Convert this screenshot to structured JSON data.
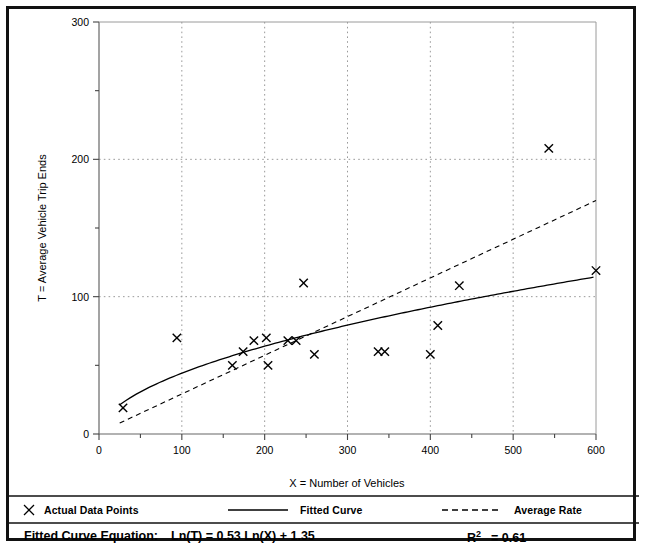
{
  "chart_data": {
    "type": "scatter",
    "title": "",
    "xlabel": "X = Number of Vehicles",
    "ylabel": "T = Average Vehicle Trip Ends",
    "xlim": [
      0,
      600
    ],
    "ylim": [
      0,
      300
    ],
    "xticks": [
      0,
      100,
      200,
      300,
      400,
      500,
      600
    ],
    "yticks": [
      0,
      100,
      200,
      300
    ],
    "xtick_labels": [
      "0",
      "100",
      "200",
      "300",
      "400",
      "500",
      "600"
    ],
    "ytick_labels": [
      "0",
      "100",
      "200",
      "300"
    ],
    "x_minor_ticks": [
      50,
      150,
      250,
      350,
      450,
      550
    ],
    "y_minor_ticks": [
      50,
      150,
      250
    ],
    "grid": "dotted-both",
    "legend_position": "bottom",
    "series": [
      {
        "name": "Actual Data Points",
        "type": "scatter",
        "marker": "x",
        "points": [
          [
            29,
            19
          ],
          [
            94,
            70
          ],
          [
            161,
            50
          ],
          [
            174,
            60
          ],
          [
            187,
            68
          ],
          [
            202,
            70
          ],
          [
            204,
            50
          ],
          [
            228,
            68
          ],
          [
            238,
            68
          ],
          [
            247,
            110
          ],
          [
            260,
            58
          ],
          [
            337,
            60
          ],
          [
            345,
            60
          ],
          [
            400,
            58
          ],
          [
            409,
            79
          ],
          [
            435,
            108
          ],
          [
            543,
            208
          ],
          [
            600,
            119
          ]
        ]
      },
      {
        "name": "Fitted Curve",
        "type": "line",
        "style": "solid",
        "equation": "Ln(T) = 0.53 Ln(X) + 1.35",
        "a": 3.857,
        "b": 0.53
      },
      {
        "name": "Average Rate",
        "type": "line",
        "style": "dashed",
        "points": [
          [
            25,
            8
          ],
          [
            600,
            170
          ]
        ]
      }
    ]
  },
  "legend": {
    "items": [
      {
        "label": "Actual Data Points",
        "marker": "x-marker",
        "color": "#000000"
      },
      {
        "label": "Fitted Curve",
        "marker": "solid-line",
        "color": "#000000"
      },
      {
        "label": "Average Rate",
        "marker": "dashed-line",
        "color": "#000000"
      }
    ]
  },
  "footer": {
    "equation_label": "Fitted Curve Equation:",
    "equation_value": "Ln(T) = 0.53 Ln(X) + 1.35",
    "r_squared_base": "R",
    "r_squared_exp": "2",
    "r_squared_value": "= 0.61"
  },
  "colors": {
    "frame": "#111111",
    "axis": "#555555",
    "grid": "#9a9a9a",
    "data": "#000000"
  }
}
